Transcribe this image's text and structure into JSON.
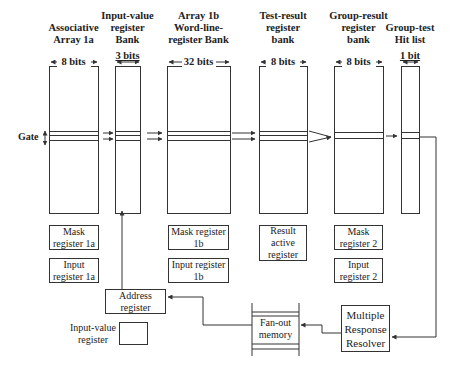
{
  "diagram": {
    "columns": [
      {
        "id": "assoc",
        "title": "Associative Array 1a",
        "lines": [
          "Associative",
          "Array 1a"
        ],
        "bits": "8 bits",
        "x": 49,
        "w": 49
      },
      {
        "id": "inval",
        "title": "Input-value register Bank",
        "lines": [
          "Input-value",
          "register",
          "Bank"
        ],
        "bits": "3 bits",
        "x": 115,
        "w": 25
      },
      {
        "id": "arr1b",
        "title": "Array 1b Word-line-register Bank",
        "lines": [
          "Array 1b",
          "Word-line-",
          "register Bank"
        ],
        "bits": "32 bits",
        "x": 167,
        "w": 63
      },
      {
        "id": "test",
        "title": "Test-result register bank",
        "lines": [
          "Test-result",
          "register",
          "bank"
        ],
        "bits": "8 bits",
        "x": 259,
        "w": 48
      },
      {
        "id": "group",
        "title": "Group-result register bank",
        "lines": [
          "Group-result",
          "register",
          "bank"
        ],
        "bits": "8 bits",
        "x": 334,
        "w": 49
      },
      {
        "id": "hit",
        "title": "Group-test Hit list",
        "lines": [
          "Group-test",
          "Hit list"
        ],
        "bits": "1 bit",
        "x": 401,
        "w": 18
      }
    ],
    "gate_label": "Gate",
    "registers": [
      {
        "id": "mask-1a",
        "lines": [
          "Mask",
          "register  1a"
        ],
        "x": 49,
        "y": 225,
        "w": 50,
        "h": 25
      },
      {
        "id": "input-1a",
        "lines": [
          "Input",
          "register  1a"
        ],
        "x": 49,
        "y": 258,
        "w": 50,
        "h": 25
      },
      {
        "id": "mask-1b",
        "lines": [
          "Mask register",
          "1b"
        ],
        "x": 168,
        "y": 225,
        "w": 61,
        "h": 25
      },
      {
        "id": "input-1b",
        "lines": [
          "Input register",
          "1b"
        ],
        "x": 168,
        "y": 258,
        "w": 61,
        "h": 25
      },
      {
        "id": "result-active",
        "lines": [
          "Result",
          "active",
          "register"
        ],
        "x": 259,
        "y": 225,
        "w": 48,
        "h": 36
      },
      {
        "id": "mask-2",
        "lines": [
          "Mask",
          "register  2"
        ],
        "x": 334,
        "y": 225,
        "w": 49,
        "h": 25
      },
      {
        "id": "input-2",
        "lines": [
          "Input",
          "register  2"
        ],
        "x": 334,
        "y": 258,
        "w": 49,
        "h": 25
      },
      {
        "id": "address",
        "lines": [
          "Address",
          "register"
        ],
        "x": 105,
        "y": 289,
        "w": 61,
        "h": 25
      },
      {
        "id": "input-value-reg",
        "lines": [
          ""
        ],
        "x": 119,
        "y": 322,
        "w": 29,
        "h": 23
      },
      {
        "id": "mrr",
        "lines": [
          "Multiple",
          "Response",
          "Resolver"
        ],
        "x": 341,
        "y": 305,
        "w": 49,
        "h": 47
      },
      {
        "id": "fanout",
        "lines": [
          "Fan-out",
          "memory"
        ],
        "x": 252,
        "y": 312,
        "w": 47,
        "h": 34
      }
    ],
    "input_value_register_label": [
      "Input-value",
      "register"
    ],
    "colors": {
      "line": "#333333",
      "text": "#222222",
      "background": "#ffffff"
    }
  }
}
